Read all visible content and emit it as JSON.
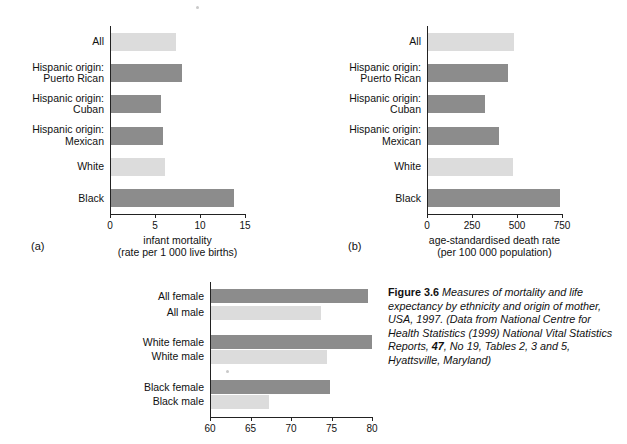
{
  "figure": {
    "label": "Figure 3.6",
    "caption_italic": "Measures of mortality and life expectancy by ethnicity and origin of mother, USA, 1997. (Data from National Centre for Health Statistics (1999) National Vital Statistics Reports, ",
    "caption_vol": "47",
    "caption_tail": ", No 19, Tables 2, 3 and 5, Hyattsville, Maryland)"
  },
  "panels": {
    "a": {
      "letter": "(a)"
    },
    "b": {
      "letter": "(b)"
    },
    "c": {
      "letter": ""
    }
  },
  "colors": {
    "dark": "#8c8c8c",
    "light": "#dcdcdc",
    "axis": "#222222"
  },
  "chart_data": [
    {
      "type": "bar",
      "panel": "(a)",
      "orientation": "horizontal",
      "title": "",
      "xlabel": "infant mortality (rate per 1 000 live births)",
      "xlabel_line1": "infant mortality",
      "xlabel_line2": "(rate per 1 000 live births)",
      "ylabel": "",
      "xlim": [
        0,
        15
      ],
      "xticks": [
        0,
        5,
        10,
        15
      ],
      "grid": false,
      "categories": [
        "All",
        "Hispanic origin: Puerto Rican",
        "Hispanic origin: Cuban",
        "Hispanic origin: Mexican",
        "White",
        "Black"
      ],
      "category_lines": [
        [
          "All"
        ],
        [
          "Hispanic origin:",
          "Puerto Rican"
        ],
        [
          "Hispanic origin:",
          "Cuban"
        ],
        [
          "Hispanic origin:",
          "Mexican"
        ],
        [
          "White"
        ],
        [
          "Black"
        ]
      ],
      "values": [
        7.2,
        7.9,
        5.5,
        5.8,
        6.0,
        13.7
      ],
      "shades": [
        "light",
        "dark",
        "dark",
        "dark",
        "light",
        "dark"
      ]
    },
    {
      "type": "bar",
      "panel": "(b)",
      "orientation": "horizontal",
      "title": "",
      "xlabel": "age-standardised death rate (per 100 000 population)",
      "xlabel_line1": "age-standardised death rate",
      "xlabel_line2": "(per 100 000 population)",
      "ylabel": "",
      "xlim": [
        0,
        750
      ],
      "xticks": [
        0,
        250,
        500,
        750
      ],
      "grid": false,
      "categories": [
        "All",
        "Hispanic origin: Puerto Rican",
        "Hispanic origin: Cuban",
        "Hispanic origin: Mexican",
        "White",
        "Black"
      ],
      "category_lines": [
        [
          "All"
        ],
        [
          "Hispanic origin:",
          "Puerto Rican"
        ],
        [
          "Hispanic origin:",
          "Cuban"
        ],
        [
          "Hispanic origin:",
          "Mexican"
        ],
        [
          "White"
        ],
        [
          "Black"
        ]
      ],
      "values": [
        480,
        445,
        315,
        395,
        470,
        735
      ],
      "shades": [
        "light",
        "dark",
        "dark",
        "dark",
        "light",
        "dark"
      ]
    },
    {
      "type": "bar",
      "panel": "(c)",
      "orientation": "horizontal",
      "title": "",
      "xlabel": "",
      "ylabel": "",
      "xlim": [
        60,
        80
      ],
      "xticks": [
        60,
        65,
        70,
        75,
        80
      ],
      "grid": false,
      "categories": [
        "All female",
        "All male",
        "White female",
        "White male",
        "Black female",
        "Black male"
      ],
      "category_lines": [
        [
          "All female"
        ],
        [
          "All male"
        ],
        [
          "White female"
        ],
        [
          "White male"
        ],
        [
          "Black female"
        ],
        [
          "Black male"
        ]
      ],
      "values": [
        79.4,
        73.6,
        79.9,
        74.3,
        74.7,
        67.2
      ],
      "shades": [
        "dark",
        "light",
        "dark",
        "light",
        "dark",
        "light"
      ]
    }
  ]
}
